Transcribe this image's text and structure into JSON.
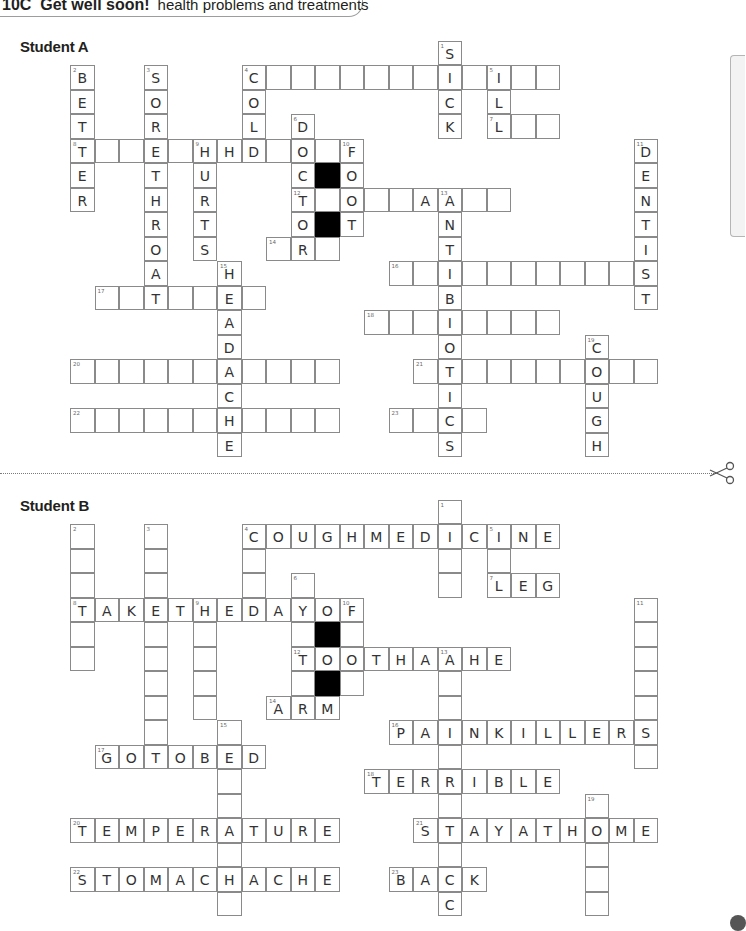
{
  "header": {
    "unit": "10C",
    "title": "Get well soon!",
    "subtitle": "health problems and treatments"
  },
  "cell_size": 24.5,
  "puzzles": [
    {
      "id": "student-a",
      "label": "Student A",
      "label_top": 38,
      "origin_x": 70,
      "origin_y": 65,
      "black_cells": [
        [
          10,
          4
        ],
        [
          10,
          6
        ]
      ],
      "entries": [
        {
          "num": "1",
          "dir": "down",
          "col": 15,
          "row": -1,
          "answer": "SICK",
          "shown": "SICK"
        },
        {
          "num": "2",
          "dir": "down",
          "col": 0,
          "row": 0,
          "answer": "BETTER",
          "shown": "BETTER"
        },
        {
          "num": "3",
          "dir": "down",
          "col": 3,
          "row": 0,
          "answer": "SORETHROAT",
          "shown": "SORETHROAT"
        },
        {
          "num": "4",
          "dir": "across",
          "col": 7,
          "row": 0,
          "answer": "COUGHMEDICINE",
          "shown": "C           "
        },
        {
          "num": "4",
          "dir": "down",
          "col": 7,
          "row": 0,
          "answer": "COLD",
          "shown": "COLD"
        },
        {
          "num": "5",
          "dir": "down",
          "col": 17,
          "row": 0,
          "answer": "ILL",
          "shown": "ILL"
        },
        {
          "num": "6",
          "dir": "down",
          "col": 9,
          "row": 2,
          "answer": "DOCTOR",
          "shown": "DOCTOR"
        },
        {
          "num": "7",
          "dir": "across",
          "col": 17,
          "row": 2,
          "answer": "LEG",
          "shown": "L  "
        },
        {
          "num": "8",
          "dir": "across",
          "col": 0,
          "row": 3,
          "answer": "TAKETHEDAYOF",
          "shown": "T     H    O "
        },
        {
          "num": "9",
          "dir": "down",
          "col": 5,
          "row": 3,
          "answer": "HURTS",
          "shown": "HURTS"
        },
        {
          "num": "10",
          "dir": "down",
          "col": 11,
          "row": 3,
          "answer": "FOOT",
          "shown": "FOOT"
        },
        {
          "num": "11",
          "dir": "down",
          "col": 23,
          "row": 3,
          "answer": "DENTIST",
          "shown": "DENTIST"
        },
        {
          "num": "12",
          "dir": "across",
          "col": 9,
          "row": 5,
          "answer": "TOOTHACHE",
          "shown": "T O  A   "
        },
        {
          "num": "13",
          "dir": "down",
          "col": 15,
          "row": 5,
          "answer": "ANTIBIOTICS",
          "shown": "ANTIBIOTICS"
        },
        {
          "num": "14",
          "dir": "across",
          "col": 8,
          "row": 7,
          "answer": "ARM",
          "shown": " R "
        },
        {
          "num": "15",
          "dir": "down",
          "col": 6,
          "row": 8,
          "answer": "HEADACHE",
          "shown": "HEADACHE"
        },
        {
          "num": "16",
          "dir": "across",
          "col": 13,
          "row": 8,
          "answer": "PAINKILLERS",
          "shown": "  I       S"
        },
        {
          "num": "17",
          "dir": "across",
          "col": 1,
          "row": 9,
          "answer": "GOTOBED",
          "shown": "  T  E "
        },
        {
          "num": "18",
          "dir": "across",
          "col": 12,
          "row": 10,
          "answer": "TERRIBLE",
          "shown": "   I    "
        },
        {
          "num": "19",
          "dir": "down",
          "col": 21,
          "row": 11,
          "answer": "COUGH",
          "shown": "COUGH"
        },
        {
          "num": "20",
          "dir": "across",
          "col": 0,
          "row": 12,
          "answer": "TEMPERATURE",
          "shown": "      A    "
        },
        {
          "num": "21",
          "dir": "across",
          "col": 14,
          "row": 12,
          "answer": "STAYATHOME",
          "shown": " T     O  "
        },
        {
          "num": "22",
          "dir": "across",
          "col": 0,
          "row": 14,
          "answer": "STOMACHACHE",
          "shown": "      H    "
        },
        {
          "num": "23",
          "dir": "across",
          "col": 13,
          "row": 14,
          "answer": "BACK",
          "shown": "  C "
        }
      ]
    },
    {
      "id": "student-b",
      "label": "Student B",
      "label_top": 497,
      "origin_x": 70,
      "origin_y": 524,
      "black_cells": [
        [
          10,
          4
        ],
        [
          10,
          6
        ]
      ],
      "entries": [
        {
          "num": "1",
          "dir": "down",
          "col": 15,
          "row": -1,
          "answer": "SICK",
          "shown": " I  "
        },
        {
          "num": "2",
          "dir": "down",
          "col": 0,
          "row": 0,
          "answer": "BETTER",
          "shown": "   T  "
        },
        {
          "num": "3",
          "dir": "down",
          "col": 3,
          "row": 0,
          "answer": "SORETHROAT",
          "shown": "   E      "
        },
        {
          "num": "4",
          "dir": "across",
          "col": 7,
          "row": 0,
          "answer": "COUGHMEDICINE",
          "shown": "COUGHMEDICINE"
        },
        {
          "num": "4",
          "dir": "down",
          "col": 7,
          "row": 0,
          "answer": "COLD",
          "shown": "C  D"
        },
        {
          "num": "5",
          "dir": "down",
          "col": 17,
          "row": 0,
          "answer": "ILL",
          "shown": "I L"
        },
        {
          "num": "6",
          "dir": "down",
          "col": 9,
          "row": 2,
          "answer": "DOCTOR",
          "shown": " O T R"
        },
        {
          "num": "7",
          "dir": "across",
          "col": 17,
          "row": 2,
          "answer": "LEG",
          "shown": "LEG"
        },
        {
          "num": "8",
          "dir": "across",
          "col": 0,
          "row": 3,
          "answer": "TAKETHEDAYOF",
          "shown": "TAKETHEDAYOF"
        },
        {
          "num": "9",
          "dir": "down",
          "col": 5,
          "row": 3,
          "answer": "HURTS",
          "shown": "H    "
        },
        {
          "num": "10",
          "dir": "down",
          "col": 11,
          "row": 3,
          "answer": "FOOT",
          "shown": "F O "
        },
        {
          "num": "11",
          "dir": "down",
          "col": 23,
          "row": 3,
          "answer": "DENTIST",
          "shown": "     S "
        },
        {
          "num": "12",
          "dir": "across",
          "col": 9,
          "row": 5,
          "answer": "TOOTHACHE",
          "shown": "TOOTHACHE"
        },
        {
          "num": "13",
          "dir": "down",
          "col": 15,
          "row": 5,
          "answer": "ANTIBIOTICS",
          "shown": "A  I I T  C "
        },
        {
          "num": "14",
          "dir": "across",
          "col": 8,
          "row": 7,
          "answer": "ARM",
          "shown": "ARM"
        },
        {
          "num": "15",
          "dir": "down",
          "col": 6,
          "row": 8,
          "answer": "HEADACHE",
          "shown": " E  A H "
        },
        {
          "num": "16",
          "dir": "across",
          "col": 13,
          "row": 8,
          "answer": "PAINKILLERS",
          "shown": "PAINKILLERS"
        },
        {
          "num": "17",
          "dir": "across",
          "col": 1,
          "row": 9,
          "answer": "GOTOBED",
          "shown": "GOTOBED"
        },
        {
          "num": "18",
          "dir": "across",
          "col": 12,
          "row": 10,
          "answer": "TERRIBLE",
          "shown": "TERRIBLE"
        },
        {
          "num": "19",
          "dir": "down",
          "col": 21,
          "row": 11,
          "answer": "COUGH",
          "shown": " O   "
        },
        {
          "num": "20",
          "dir": "across",
          "col": 0,
          "row": 12,
          "answer": "TEMPERATURE",
          "shown": "TEMPERATURE"
        },
        {
          "num": "21",
          "dir": "across",
          "col": 14,
          "row": 12,
          "answer": "STAYATHOME",
          "shown": "STAYATHOME"
        },
        {
          "num": "22",
          "dir": "across",
          "col": 0,
          "row": 14,
          "answer": "STOMACHACHE",
          "shown": "STOMACHACHE"
        },
        {
          "num": "23",
          "dir": "across",
          "col": 13,
          "row": 14,
          "answer": "BACK",
          "shown": "BACK"
        }
      ]
    }
  ]
}
